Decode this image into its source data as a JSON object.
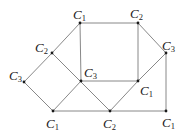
{
  "diagram": {
    "type": "graph-coloring",
    "nodes": [
      {
        "id": "n1",
        "x": 80,
        "y": 23,
        "color": "C",
        "sub": "1",
        "lx": 73,
        "ly": 19
      },
      {
        "id": "n2",
        "x": 138,
        "y": 23,
        "color": "C",
        "sub": "2",
        "lx": 130,
        "ly": 18
      },
      {
        "id": "n3",
        "x": 52,
        "y": 53,
        "color": "C",
        "sub": "2",
        "lx": 35,
        "ly": 52
      },
      {
        "id": "n4",
        "x": 166,
        "y": 53,
        "color": "C",
        "sub": "3",
        "lx": 162,
        "ly": 50
      },
      {
        "id": "n5",
        "x": 24,
        "y": 82,
        "color": "C",
        "sub": "3",
        "lx": 9,
        "ly": 80
      },
      {
        "id": "n6",
        "x": 81,
        "y": 81,
        "color": "C",
        "sub": "3",
        "lx": 84,
        "ly": 77
      },
      {
        "id": "n7",
        "x": 138,
        "y": 81,
        "color": "C",
        "sub": "1",
        "lx": 140,
        "ly": 95
      },
      {
        "id": "n8",
        "x": 53,
        "y": 111,
        "color": "C",
        "sub": "1",
        "lx": 46,
        "ly": 128
      },
      {
        "id": "n9",
        "x": 110,
        "y": 111,
        "color": "C",
        "sub": "2",
        "lx": 103,
        "ly": 128
      },
      {
        "id": "n10",
        "x": 166,
        "y": 111,
        "color": "C",
        "sub": "1",
        "lx": 162,
        "ly": 127
      }
    ],
    "edges": [
      [
        "n1",
        "n2"
      ],
      [
        "n1",
        "n3"
      ],
      [
        "n1",
        "n6"
      ],
      [
        "n2",
        "n7"
      ],
      [
        "n2",
        "n4"
      ],
      [
        "n3",
        "n5"
      ],
      [
        "n3",
        "n9"
      ],
      [
        "n5",
        "n8"
      ],
      [
        "n6",
        "n7"
      ],
      [
        "n6",
        "n8"
      ],
      [
        "n7",
        "n4"
      ],
      [
        "n7",
        "n9"
      ],
      [
        "n4",
        "n10"
      ],
      [
        "n8",
        "n9"
      ],
      [
        "n9",
        "n10"
      ]
    ]
  }
}
